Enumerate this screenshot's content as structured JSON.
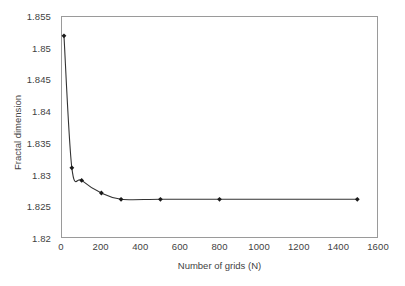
{
  "chart_data": {
    "type": "line",
    "title": "",
    "subtitle": "",
    "xlabel": "Number of grids (N)",
    "ylabel": "Fractal dimension",
    "xlim": [
      0,
      1600
    ],
    "ylim": [
      1.82,
      1.855
    ],
    "xticks": [
      0,
      200,
      400,
      600,
      800,
      1000,
      1200,
      1400,
      1600
    ],
    "xtick_labels": [
      "0",
      "200",
      "400",
      "600",
      "800",
      "1000",
      "1200",
      "1400",
      "1600"
    ],
    "yticks": [
      1.82,
      1.825,
      1.83,
      1.835,
      1.84,
      1.845,
      1.85,
      1.855
    ],
    "ytick_labels": [
      "1.82",
      "1.825",
      "1.83",
      "1.835",
      "1.84",
      "1.845",
      "1.85",
      "1.855"
    ],
    "grid": false,
    "legend": false,
    "legend_position": "none",
    "marker": "diamond",
    "line_color": "#333333",
    "marker_color": "#1a1a1a",
    "plot_background": "#ffffff",
    "axis_color": "#9a9a9a",
    "text_color": "#3f3f3f",
    "x": [
      10,
      50,
      100,
      200,
      300,
      500,
      800,
      1500
    ],
    "y": [
      1.852,
      1.831,
      1.829,
      1.827,
      1.826,
      1.826,
      1.826,
      1.826
    ],
    "series": [
      {
        "name": "Fractal dimension vs number of grids",
        "points": [
          {
            "x": 10,
            "y": 1.852
          },
          {
            "x": 50,
            "y": 1.831
          },
          {
            "x": 100,
            "y": 1.829
          },
          {
            "x": 200,
            "y": 1.827
          },
          {
            "x": 300,
            "y": 1.826
          },
          {
            "x": 500,
            "y": 1.826
          },
          {
            "x": 800,
            "y": 1.826
          },
          {
            "x": 1500,
            "y": 1.826
          }
        ]
      }
    ],
    "annotations": []
  }
}
